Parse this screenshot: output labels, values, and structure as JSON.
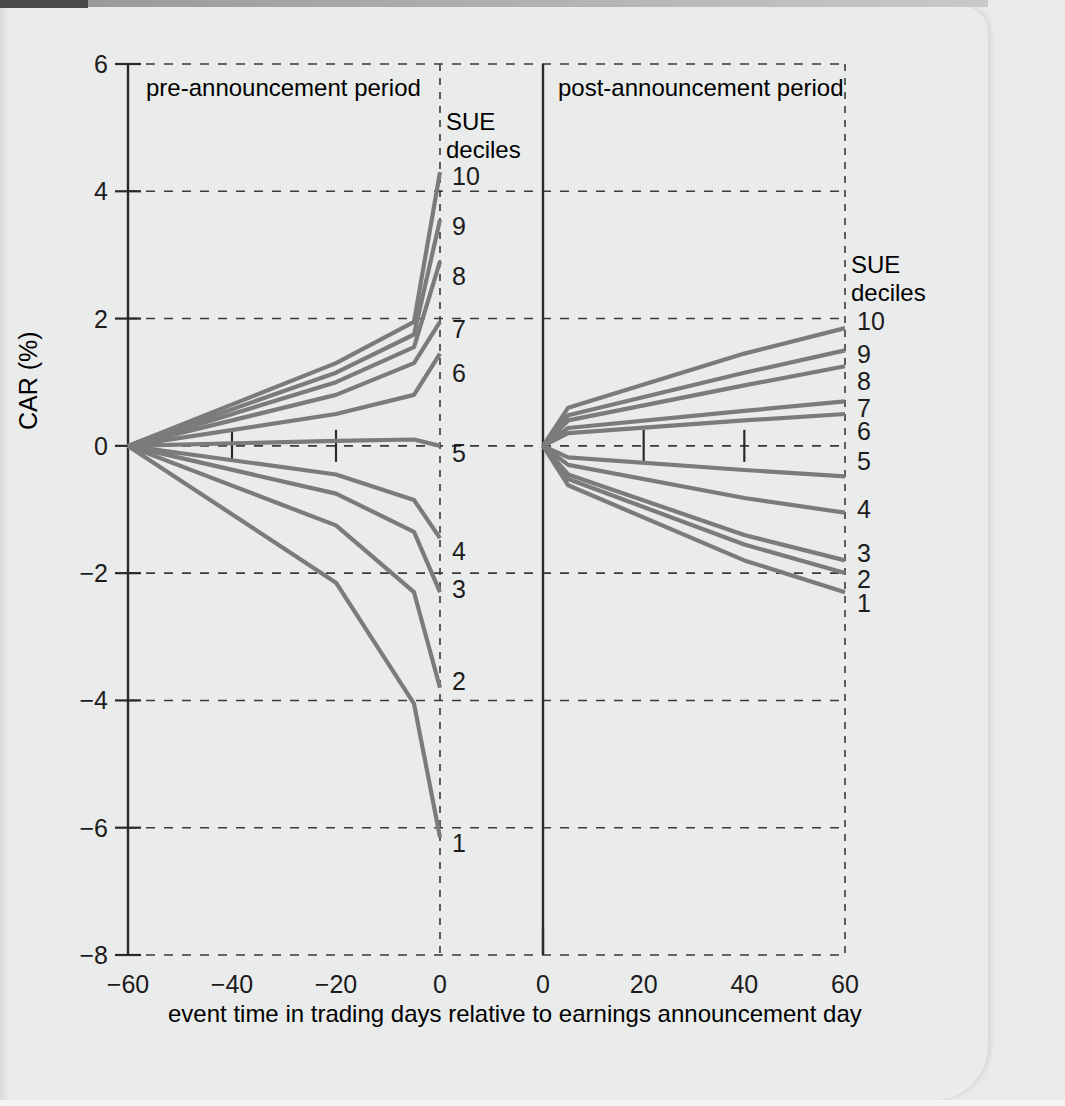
{
  "figure": {
    "y_axis_label": "CAR (%)",
    "x_axis_label": "event time in trading days relative to earnings announcement day",
    "left_panel_title": "pre-announcement period",
    "right_panel_title": "post-announcement period",
    "legend_title_line1": "SUE",
    "legend_title_line2": "deciles"
  },
  "chart_data": {
    "type": "line",
    "title": "",
    "xlabel": "event time in trading days relative to earnings announcement day",
    "ylabel": "CAR (%)",
    "ylim": [
      -8,
      6
    ],
    "yticks": [
      6,
      4,
      2,
      0,
      -2,
      -4,
      -6,
      -8
    ],
    "ytick_labels": [
      "6",
      "4",
      "2",
      "0",
      "−2",
      "−4",
      "−6",
      "−8"
    ],
    "grid": true,
    "legend_position": "right of each panel",
    "panels": [
      {
        "name": "pre-announcement period",
        "xlim": [
          -60,
          0
        ],
        "xticks": [
          -60,
          -40,
          -20,
          0
        ],
        "xtick_labels": [
          "−60",
          "−40",
          "−20",
          "0"
        ],
        "minor_xticks": [
          -40,
          -20
        ],
        "legend_title": "SUE deciles",
        "series": [
          {
            "name": "10",
            "x": [
              -60,
              -20,
              -5,
              0
            ],
            "y": [
              0.0,
              1.3,
              1.95,
              4.3
            ]
          },
          {
            "name": "9",
            "x": [
              -60,
              -20,
              -5,
              0
            ],
            "y": [
              0.0,
              1.15,
              1.75,
              3.55
            ]
          },
          {
            "name": "8",
            "x": [
              -60,
              -20,
              -5,
              0
            ],
            "y": [
              0.0,
              1.0,
              1.55,
              2.9
            ]
          },
          {
            "name": "7",
            "x": [
              -60,
              -20,
              -5,
              0
            ],
            "y": [
              0.0,
              0.8,
              1.3,
              1.95
            ]
          },
          {
            "name": "6",
            "x": [
              -60,
              -20,
              -5,
              0
            ],
            "y": [
              0.0,
              0.5,
              0.8,
              1.45
            ]
          },
          {
            "name": "5",
            "x": [
              -60,
              -20,
              -5,
              0
            ],
            "y": [
              0.0,
              0.08,
              0.1,
              0.0
            ]
          },
          {
            "name": "4",
            "x": [
              -60,
              -20,
              -5,
              0
            ],
            "y": [
              0.0,
              -0.45,
              -0.85,
              -1.45
            ]
          },
          {
            "name": "3",
            "x": [
              -60,
              -20,
              -5,
              0
            ],
            "y": [
              0.0,
              -0.75,
              -1.35,
              -2.3
            ]
          },
          {
            "name": "2",
            "x": [
              -60,
              -20,
              -5,
              0
            ],
            "y": [
              0.0,
              -1.25,
              -2.3,
              -3.8
            ]
          },
          {
            "name": "1",
            "x": [
              -60,
              -20,
              -5,
              0
            ],
            "y": [
              0.0,
              -2.15,
              -4.05,
              -6.15
            ]
          }
        ]
      },
      {
        "name": "post-announcement period",
        "xlim": [
          0,
          60
        ],
        "xticks": [
          0,
          20,
          40,
          60
        ],
        "xtick_labels": [
          "0",
          "20",
          "40",
          "60"
        ],
        "minor_xticks": [
          20,
          40
        ],
        "legend_title": "SUE deciles",
        "series": [
          {
            "name": "10",
            "x": [
              0,
              5,
              40,
              60
            ],
            "y": [
              0.0,
              0.6,
              1.45,
              1.85
            ]
          },
          {
            "name": "9",
            "x": [
              0,
              5,
              40,
              60
            ],
            "y": [
              0.0,
              0.48,
              1.15,
              1.5
            ]
          },
          {
            "name": "8",
            "x": [
              0,
              5,
              40,
              60
            ],
            "y": [
              0.0,
              0.4,
              0.95,
              1.25
            ]
          },
          {
            "name": "7",
            "x": [
              0,
              5,
              40,
              60
            ],
            "y": [
              0.0,
              0.28,
              0.55,
              0.7
            ]
          },
          {
            "name": "6",
            "x": [
              0,
              5,
              40,
              60
            ],
            "y": [
              0.0,
              0.2,
              0.4,
              0.5
            ]
          },
          {
            "name": "5",
            "x": [
              0,
              5,
              40,
              60
            ],
            "y": [
              0.0,
              -0.18,
              -0.38,
              -0.48
            ]
          },
          {
            "name": "4",
            "x": [
              0,
              5,
              40,
              60
            ],
            "y": [
              0.0,
              -0.3,
              -0.82,
              -1.05
            ]
          },
          {
            "name": "3",
            "x": [
              0,
              5,
              40,
              60
            ],
            "y": [
              0.0,
              -0.45,
              -1.4,
              -1.8
            ]
          },
          {
            "name": "2",
            "x": [
              0,
              5,
              40,
              60
            ],
            "y": [
              0.0,
              -0.52,
              -1.55,
              -2.0
            ]
          },
          {
            "name": "1",
            "x": [
              0,
              5,
              40,
              60
            ],
            "y": [
              0.0,
              -0.62,
              -1.8,
              -2.3
            ]
          }
        ]
      }
    ]
  },
  "colors": {
    "series": "#7b7b7b",
    "axis": "#2a2a2a",
    "grid": "#3a3a3a",
    "paper": "#eaebeb"
  }
}
